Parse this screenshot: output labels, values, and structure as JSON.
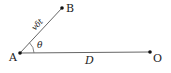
{
  "diagram": {
    "points": {
      "A": {
        "label": "A",
        "x": 20,
        "y": 53
      },
      "B": {
        "label": "B",
        "x": 62,
        "y": 8
      },
      "O": {
        "label": "O",
        "x": 150,
        "y": 52
      }
    },
    "segments": [
      {
        "from": "A",
        "to": "B",
        "label": "vδt"
      },
      {
        "from": "A",
        "to": "O",
        "label": "D"
      }
    ],
    "angle": {
      "vertex": "A",
      "label": "θ"
    },
    "colors": {
      "line": "#555555",
      "point": "#111111",
      "text": "#222222"
    }
  }
}
